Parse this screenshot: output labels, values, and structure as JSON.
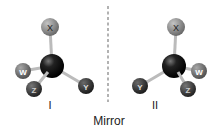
{
  "diagram": {
    "caption": "Mirror",
    "molecules": [
      {
        "label": "I",
        "atoms": {
          "center": {
            "symbol": "",
            "x": 52,
            "y": 66,
            "r": 12,
            "color": "#111111"
          },
          "X": {
            "symbol": "X",
            "x": 50,
            "y": 27,
            "r": 9,
            "color": "#8a8a8a"
          },
          "W": {
            "symbol": "W",
            "x": 23,
            "y": 71,
            "r": 8,
            "color": "#6e6e6e"
          },
          "Z": {
            "symbol": "Z",
            "x": 34,
            "y": 89,
            "r": 8,
            "color": "#3a3a3a"
          },
          "Y": {
            "symbol": "Y",
            "x": 86,
            "y": 86,
            "r": 8,
            "color": "#2e2e2e"
          }
        }
      },
      {
        "label": "II",
        "atoms": {
          "center": {
            "symbol": "",
            "x": 174,
            "y": 66,
            "r": 12,
            "color": "#111111"
          },
          "X": {
            "symbol": "X",
            "x": 176,
            "y": 27,
            "r": 9,
            "color": "#8a8a8a"
          },
          "W": {
            "symbol": "W",
            "x": 199,
            "y": 71,
            "r": 8,
            "color": "#6e6e6e"
          },
          "Z": {
            "symbol": "Z",
            "x": 188,
            "y": 89,
            "r": 8,
            "color": "#3a3a3a"
          },
          "Y": {
            "symbol": "Y",
            "x": 140,
            "y": 86,
            "r": 8,
            "color": "#2e2e2e"
          }
        }
      }
    ]
  }
}
